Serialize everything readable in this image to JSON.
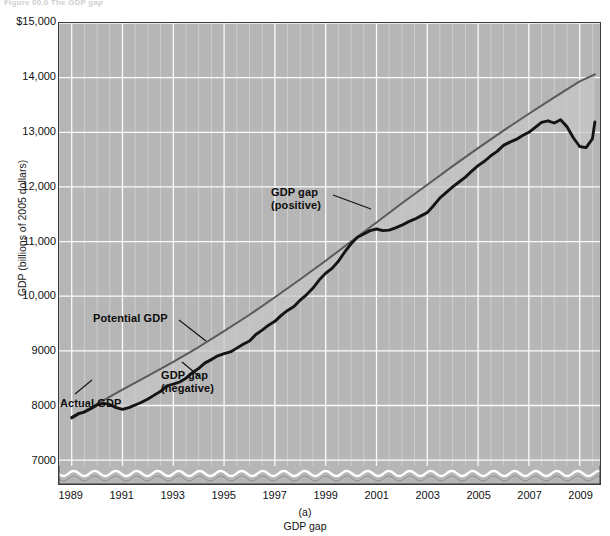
{
  "figure": {
    "header_fragment": "Figure 00.0  The GDP gap",
    "caption_letter": "(a)",
    "caption_text": "GDP gap"
  },
  "axes": {
    "y_title": "GDP (billions of 2005 dollars)",
    "y_ticks": [
      "$15,000",
      "14,000",
      "13,000",
      "12,000",
      "11,000",
      "10,000",
      "9000",
      "8000",
      "7000"
    ],
    "x_ticks": [
      "1989",
      "1991",
      "1993",
      "1995",
      "1997",
      "1999",
      "2001",
      "2003",
      "2005",
      "2007",
      "2009"
    ]
  },
  "annotations": {
    "potential_gdp": "Potential GDP",
    "actual_gdp": "Actual GDP",
    "gap_positive_line1": "GDP gap",
    "gap_positive_line2": "(positive)",
    "gap_negative_line1": "GDP gap",
    "gap_negative_line2": "(negative)"
  },
  "colors": {
    "plot_background": "#b6b6b6",
    "gridline": "#ffffff",
    "axis_frame": "#3a3a3a",
    "actual_gdp_line": "#141414",
    "potential_gdp_line": "#5a5a5a",
    "gap_fill": "#c6c6c6",
    "page_background": "#ffffff"
  },
  "chart_data": {
    "type": "line",
    "title": "GDP gap",
    "xlabel": "",
    "ylabel": "GDP (billions of 2005 dollars)",
    "xlim": [
      1988.5,
      2009.8
    ],
    "ylim": [
      6600,
      15000
    ],
    "y_major_ticks": [
      7000,
      8000,
      9000,
      10000,
      11000,
      12000,
      13000,
      14000,
      15000
    ],
    "x_major_ticks": [
      1989,
      1991,
      1993,
      1995,
      1997,
      1999,
      2001,
      2003,
      2005,
      2007,
      2009
    ],
    "x_minor_step": 0.5,
    "grid": true,
    "y_axis_broken_at_bottom": true,
    "legend": "none (inline annotations)",
    "series": [
      {
        "name": "Potential GDP",
        "style": "thin smooth gray line",
        "x": [
          1989.0,
          1990.0,
          1991.0,
          1992.0,
          1993.0,
          1994.0,
          1995.0,
          1996.0,
          1997.0,
          1998.0,
          1999.0,
          2000.0,
          2001.0,
          2002.0,
          2003.0,
          2004.0,
          2005.0,
          2006.0,
          2007.0,
          2008.0,
          2009.0,
          2009.6
        ],
        "values": [
          7760,
          8030,
          8290,
          8540,
          8800,
          9070,
          9360,
          9660,
          9980,
          10310,
          10650,
          11000,
          11350,
          11700,
          12040,
          12380,
          12710,
          13030,
          13340,
          13640,
          13930,
          14060
        ]
      },
      {
        "name": "Actual GDP",
        "style": "thick jagged black line",
        "x": [
          1989.0,
          1989.25,
          1989.5,
          1989.75,
          1990.0,
          1990.25,
          1990.5,
          1990.75,
          1991.0,
          1991.25,
          1991.5,
          1991.75,
          1992.0,
          1992.25,
          1992.5,
          1992.75,
          1993.0,
          1993.25,
          1993.5,
          1993.75,
          1994.0,
          1994.25,
          1994.5,
          1994.75,
          1995.0,
          1995.25,
          1995.5,
          1995.75,
          1996.0,
          1996.25,
          1996.5,
          1996.75,
          1997.0,
          1997.25,
          1997.5,
          1997.75,
          1998.0,
          1998.25,
          1998.5,
          1998.75,
          1999.0,
          1999.25,
          1999.5,
          1999.75,
          2000.0,
          2000.25,
          2000.5,
          2000.75,
          2001.0,
          2001.25,
          2001.5,
          2001.75,
          2002.0,
          2002.25,
          2002.5,
          2002.75,
          2003.0,
          2003.25,
          2003.5,
          2003.75,
          2004.0,
          2004.25,
          2004.5,
          2004.75,
          2005.0,
          2005.25,
          2005.5,
          2005.75,
          2006.0,
          2006.25,
          2006.5,
          2006.75,
          2007.0,
          2007.25,
          2007.5,
          2007.75,
          2008.0,
          2008.25,
          2008.5,
          2008.75,
          2009.0,
          2009.25,
          2009.5,
          2009.6
        ],
        "values": [
          7780,
          7850,
          7880,
          7940,
          8010,
          8040,
          8020,
          7960,
          7930,
          7960,
          8010,
          8060,
          8120,
          8190,
          8260,
          8360,
          8390,
          8430,
          8500,
          8600,
          8680,
          8780,
          8840,
          8910,
          8950,
          8980,
          9050,
          9120,
          9180,
          9300,
          9380,
          9470,
          9540,
          9650,
          9740,
          9810,
          9930,
          10030,
          10150,
          10300,
          10420,
          10510,
          10640,
          10810,
          10960,
          11080,
          11140,
          11200,
          11230,
          11200,
          11210,
          11250,
          11300,
          11360,
          11410,
          11470,
          11530,
          11660,
          11800,
          11900,
          12000,
          12090,
          12180,
          12290,
          12390,
          12470,
          12570,
          12650,
          12760,
          12820,
          12870,
          12940,
          13000,
          13090,
          13180,
          13210,
          13170,
          13230,
          13100,
          12900,
          12740,
          12720,
          12880,
          13190
        ]
      }
    ],
    "annotations": [
      {
        "text": "Potential GDP",
        "points_to": "potential GDP line near 1995"
      },
      {
        "text": "Actual GDP",
        "points_to": "actual GDP line near 1989-1990"
      },
      {
        "text": "GDP gap (positive)",
        "points_to": "region between 1998 and 2001 where actual exceeds potential"
      },
      {
        "text": "GDP gap (negative)",
        "points_to": "region near 1991-1993 where actual is below potential"
      }
    ]
  }
}
